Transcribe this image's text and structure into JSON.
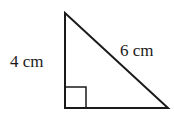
{
  "figure": {
    "type": "right-triangle",
    "labels": {
      "vertical_leg": "4 cm",
      "hypotenuse": "6 cm"
    },
    "right_angle_marker": true,
    "stroke_color": "#1a1a1a",
    "background": "#ffffff"
  }
}
